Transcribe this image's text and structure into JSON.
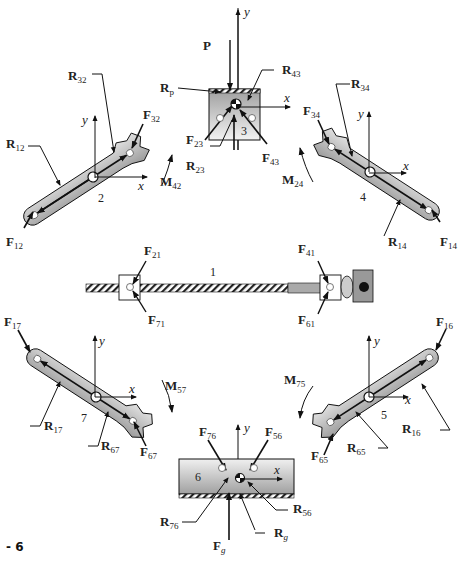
{
  "figure": {
    "caption_fragment": "- 6",
    "type": "free-body diagram of mechanism links"
  },
  "links": [
    {
      "id": "1",
      "name": "frame / slide rod",
      "labels": [
        "F21",
        "F71",
        "F41",
        "F61"
      ]
    },
    {
      "id": "2",
      "name": "link 2",
      "labels": [
        "R12",
        "R32",
        "F12",
        "F32",
        "M42"
      ]
    },
    {
      "id": "3",
      "name": "slider block 3",
      "labels": [
        "P",
        "Rp",
        "R43",
        "R23",
        "F23",
        "F43"
      ]
    },
    {
      "id": "4",
      "name": "link 4",
      "labels": [
        "R34",
        "R14",
        "F34",
        "F14",
        "M24"
      ]
    },
    {
      "id": "5",
      "name": "link 5",
      "labels": [
        "R16",
        "R65",
        "F16",
        "F65",
        "M75"
      ]
    },
    {
      "id": "6",
      "name": "slider block 6",
      "labels": [
        "F76",
        "F56",
        "R76",
        "R56",
        "Rg",
        "Fg"
      ]
    },
    {
      "id": "7",
      "name": "link 7",
      "labels": [
        "R17",
        "R67",
        "F17",
        "F67",
        "M57"
      ]
    }
  ],
  "labels": {
    "P": {
      "main": "P",
      "sub": ""
    },
    "Rp": {
      "main": "R",
      "sub": "p"
    },
    "R43": {
      "main": "R",
      "sub": "43"
    },
    "R32": {
      "main": "R",
      "sub": "32"
    },
    "R34": {
      "main": "R",
      "sub": "34"
    },
    "R12": {
      "main": "R",
      "sub": "12"
    },
    "F32": {
      "main": "F",
      "sub": "32"
    },
    "F34": {
      "main": "F",
      "sub": "34"
    },
    "F23": {
      "main": "F",
      "sub": "23"
    },
    "F43": {
      "main": "F",
      "sub": "43"
    },
    "R23": {
      "main": "R",
      "sub": "23"
    },
    "M42": {
      "main": "M",
      "sub": "42"
    },
    "M24": {
      "main": "M",
      "sub": "24"
    },
    "F12": {
      "main": "F",
      "sub": "12"
    },
    "R14": {
      "main": "R",
      "sub": "14"
    },
    "F14": {
      "main": "F",
      "sub": "14"
    },
    "F21": {
      "main": "F",
      "sub": "21"
    },
    "F71": {
      "main": "F",
      "sub": "71"
    },
    "F41": {
      "main": "F",
      "sub": "41"
    },
    "F61": {
      "main": "F",
      "sub": "61"
    },
    "F17": {
      "main": "F",
      "sub": "17"
    },
    "F16": {
      "main": "F",
      "sub": "16"
    },
    "R17": {
      "main": "R",
      "sub": "17"
    },
    "R67": {
      "main": "R",
      "sub": "67"
    },
    "F67": {
      "main": "F",
      "sub": "67"
    },
    "M57": {
      "main": "M",
      "sub": "57"
    },
    "M75": {
      "main": "M",
      "sub": "75"
    },
    "R16": {
      "main": "R",
      "sub": "16"
    },
    "R65": {
      "main": "R",
      "sub": "65"
    },
    "F65": {
      "main": "F",
      "sub": "65"
    },
    "F76": {
      "main": "F",
      "sub": "76"
    },
    "F56": {
      "main": "F",
      "sub": "56"
    },
    "R76": {
      "main": "R",
      "sub": "76"
    },
    "R56": {
      "main": "R",
      "sub": "56"
    },
    "Rg": {
      "main": "R",
      "sub": "g"
    },
    "Fg": {
      "main": "F",
      "sub": "g"
    }
  },
  "axes": {
    "x": "x",
    "y": "y"
  },
  "link_numbers": {
    "n1": "1",
    "n2": "2",
    "n3": "3",
    "n4": "4",
    "n5": "5",
    "n6": "6",
    "n7": "7"
  },
  "colors": {
    "link_fill": "#c8c8c8",
    "link_fill_dark": "#9a9a9a",
    "line": "#111111"
  }
}
